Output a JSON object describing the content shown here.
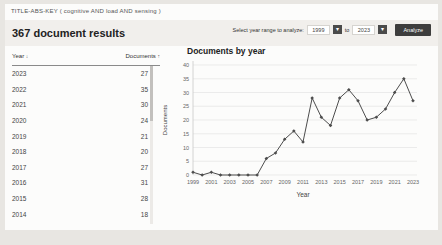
{
  "query_bar": {
    "query": "TITLE-ABS-KEY ( cognitive AND load AND sensing )"
  },
  "header": {
    "results_title": "367 document results",
    "range_selector": {
      "label": "Select year range to analyze:",
      "from_year": "1999",
      "to_word": "to",
      "to_year": "2023",
      "analyze_button": "Analyze",
      "dropdown_icon": "▾"
    }
  },
  "table": {
    "year_header": "Year",
    "year_sort_icon": "↓",
    "documents_header": "Documents",
    "documents_sort_icon": "↑",
    "rows": [
      {
        "year": "2023",
        "documents": "27"
      },
      {
        "year": "2022",
        "documents": "35"
      },
      {
        "year": "2021",
        "documents": "30"
      },
      {
        "year": "2020",
        "documents": "24"
      },
      {
        "year": "2019",
        "documents": "21"
      },
      {
        "year": "2018",
        "documents": "20"
      },
      {
        "year": "2017",
        "documents": "27"
      },
      {
        "year": "2016",
        "documents": "31"
      },
      {
        "year": "2015",
        "documents": "28"
      },
      {
        "year": "2014",
        "documents": "18"
      }
    ]
  },
  "chart_data": {
    "type": "line",
    "title": "Documents by year",
    "xlabel": "Year",
    "ylabel": "Documents",
    "x": [
      1999,
      2000,
      2001,
      2002,
      2003,
      2004,
      2005,
      2006,
      2007,
      2008,
      2009,
      2010,
      2011,
      2012,
      2013,
      2014,
      2015,
      2016,
      2017,
      2018,
      2019,
      2020,
      2021,
      2022,
      2023
    ],
    "values": [
      1,
      0,
      1,
      0,
      0,
      0,
      0,
      0,
      6,
      8,
      13,
      16,
      12,
      28,
      21,
      18,
      28,
      31,
      27,
      20,
      21,
      24,
      30,
      35,
      27
    ],
    "xlim": [
      1999,
      2023
    ],
    "ylim": [
      0,
      40
    ],
    "xticks": [
      1999,
      2001,
      2003,
      2005,
      2007,
      2009,
      2011,
      2013,
      2015,
      2017,
      2019,
      2021,
      2023
    ],
    "yticks": [
      0,
      5,
      10,
      15,
      20,
      25,
      30,
      35,
      40
    ],
    "line_color": "#4d4d4d",
    "grid_color": "#e4e4e4",
    "marker": "diamond",
    "legend": false
  },
  "colors": {
    "page_bg": "#e8e6e2",
    "card_bg": "#fcfcfb",
    "band_bg": "#f1efec",
    "button_bg": "#3d3d3d",
    "text": "#333333"
  }
}
